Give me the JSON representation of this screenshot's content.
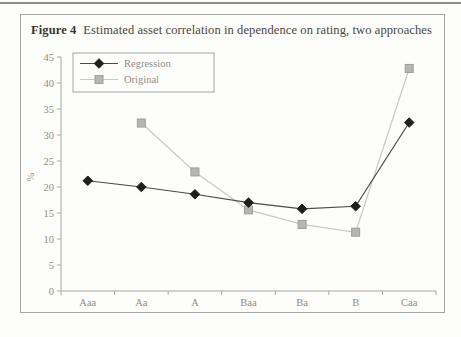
{
  "figure": {
    "label": "Figure 4",
    "title": "Estimated asset correlation in dependence on rating, two approaches"
  },
  "chart_data": {
    "type": "line",
    "categories": [
      "Aaa",
      "Aa",
      "A",
      "Baa",
      "Ba",
      "B",
      "Caa"
    ],
    "series": [
      {
        "name": "Original",
        "marker": "square",
        "line_color": "#c9c9c7",
        "marker_fill": "#b5b5b3",
        "marker_stroke": "#9e9e9b",
        "values": [
          null,
          32.3,
          22.9,
          15.6,
          12.8,
          11.3,
          42.8
        ]
      },
      {
        "name": "Regression",
        "marker": "diamond",
        "line_color": "#4a4a48",
        "marker_fill": "#1f1f1e",
        "marker_stroke": "#1f1f1e",
        "values": [
          21.2,
          20.0,
          18.6,
          17.0,
          15.8,
          16.3,
          32.4
        ]
      }
    ],
    "ylabel": "%",
    "ylim": [
      0,
      45
    ],
    "ytick_step": 5,
    "xlabel": "",
    "grid": false,
    "legend_position": "top-left",
    "legend_order": [
      "Regression",
      "Original"
    ],
    "axis_color": "#a7a7a2",
    "tick_label_color": "#948d7e"
  }
}
